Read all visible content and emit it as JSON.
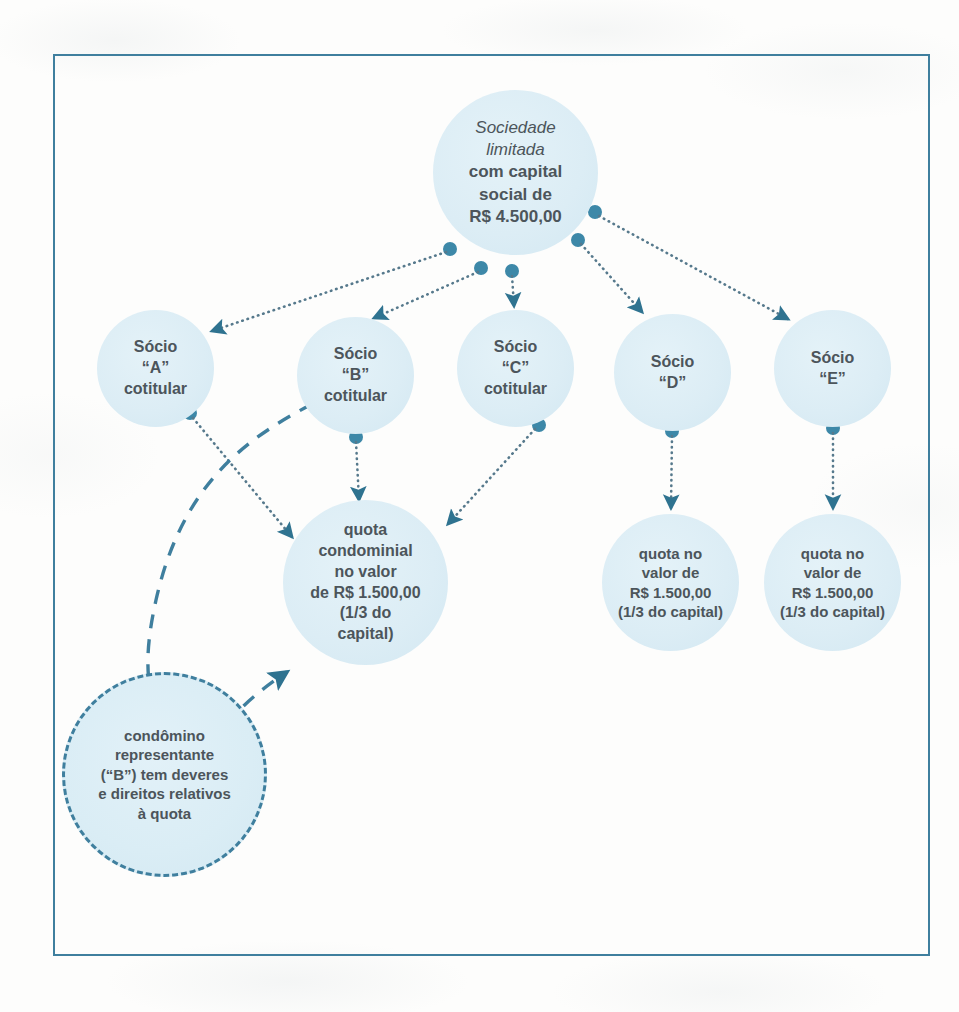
{
  "diagram": {
    "type": "organizational-flow",
    "colors": {
      "frame_border": "#3f7f9e",
      "node_fill": "#dcedf5",
      "connector": "#3f7f9e",
      "text": "#4c555b"
    },
    "nodes": [
      {
        "id": "company",
        "name": "sociedade-limitada",
        "shape": "circle",
        "style": "solid",
        "lines": [
          {
            "text": "Sociedade",
            "style": "italic"
          },
          {
            "text": "limitada",
            "style": "italic"
          },
          {
            "text": "com capital",
            "style": "bold"
          },
          {
            "text": "social de",
            "style": "bold"
          },
          {
            "text": "R$ 4.500,00",
            "style": "bold"
          }
        ]
      },
      {
        "id": "socio_a",
        "name": "socio-a",
        "shape": "circle",
        "style": "solid",
        "lines": [
          {
            "text": "Sócio",
            "style": "bold"
          },
          {
            "text": "“A”",
            "style": "bold"
          },
          {
            "text": "cotitular",
            "style": "bold"
          }
        ]
      },
      {
        "id": "socio_b",
        "name": "socio-b",
        "shape": "circle",
        "style": "solid",
        "lines": [
          {
            "text": "Sócio",
            "style": "bold"
          },
          {
            "text": "“B”",
            "style": "bold"
          },
          {
            "text": "cotitular",
            "style": "bold"
          }
        ]
      },
      {
        "id": "socio_c",
        "name": "socio-c",
        "shape": "circle",
        "style": "solid",
        "lines": [
          {
            "text": "Sócio",
            "style": "bold"
          },
          {
            "text": "“C”",
            "style": "bold"
          },
          {
            "text": "cotitular",
            "style": "bold"
          }
        ]
      },
      {
        "id": "socio_d",
        "name": "socio-d",
        "shape": "circle",
        "style": "solid",
        "lines": [
          {
            "text": "Sócio",
            "style": "bold"
          },
          {
            "text": "“D”",
            "style": "bold"
          }
        ]
      },
      {
        "id": "socio_e",
        "name": "socio-e",
        "shape": "circle",
        "style": "solid",
        "lines": [
          {
            "text": "Sócio",
            "style": "bold"
          },
          {
            "text": "“E”",
            "style": "bold"
          }
        ]
      },
      {
        "id": "quota_condominial",
        "name": "quota-condominial",
        "shape": "circle",
        "style": "solid",
        "lines": [
          {
            "text": "quota",
            "style": "bold"
          },
          {
            "text": "condominial",
            "style": "bold"
          },
          {
            "text": "no valor",
            "style": "bold"
          },
          {
            "text": "de R$ 1.500,00",
            "style": "bold"
          },
          {
            "text": "(1/3 do",
            "style": "bold"
          },
          {
            "text": "capital)",
            "style": "bold"
          }
        ]
      },
      {
        "id": "quota_d",
        "name": "quota-socio-d",
        "shape": "circle",
        "style": "solid",
        "lines": [
          {
            "text": "quota no",
            "style": "bold"
          },
          {
            "text": "valor de",
            "style": "bold"
          },
          {
            "text": "R$ 1.500,00",
            "style": "bold"
          },
          {
            "text": "(1/3 do capital)",
            "style": "bold"
          }
        ]
      },
      {
        "id": "quota_e",
        "name": "quota-socio-e",
        "shape": "circle",
        "style": "solid",
        "lines": [
          {
            "text": "quota no",
            "style": "bold"
          },
          {
            "text": "valor de",
            "style": "bold"
          },
          {
            "text": "R$ 1.500,00",
            "style": "bold"
          },
          {
            "text": "(1/3 do capital)",
            "style": "bold"
          }
        ]
      },
      {
        "id": "condomino",
        "name": "condomino-representante",
        "shape": "circle",
        "style": "dashed",
        "lines": [
          {
            "text": "condômino",
            "style": "bold"
          },
          {
            "text": "representante",
            "style": "bold"
          },
          {
            "text": "(“B”) tem deveres",
            "style": "bold"
          },
          {
            "text": "e direitos relativos",
            "style": "bold"
          },
          {
            "text": "à quota",
            "style": "bold"
          }
        ]
      }
    ],
    "edges": [
      {
        "from": "company",
        "to": "socio_a",
        "style": "dotted",
        "arrow": true
      },
      {
        "from": "company",
        "to": "socio_b",
        "style": "dotted",
        "arrow": true
      },
      {
        "from": "company",
        "to": "socio_c",
        "style": "dotted",
        "arrow": true
      },
      {
        "from": "company",
        "to": "socio_d",
        "style": "dotted",
        "arrow": true
      },
      {
        "from": "company",
        "to": "socio_e",
        "style": "dotted",
        "arrow": true
      },
      {
        "from": "socio_a",
        "to": "quota_condominial",
        "style": "dotted",
        "arrow": true
      },
      {
        "from": "socio_b",
        "to": "quota_condominial",
        "style": "dotted",
        "arrow": true
      },
      {
        "from": "socio_c",
        "to": "quota_condominial",
        "style": "dotted",
        "arrow": true
      },
      {
        "from": "socio_d",
        "to": "quota_d",
        "style": "dotted",
        "arrow": true
      },
      {
        "from": "socio_e",
        "to": "quota_e",
        "style": "dotted",
        "arrow": true
      },
      {
        "from": "socio_b",
        "to": "condomino",
        "style": "dashed",
        "arrow": true
      },
      {
        "from": "condomino",
        "to": "quota_condominial",
        "style": "dashed",
        "arrow": true
      }
    ]
  },
  "company": {
    "line1": "Sociedade",
    "line2": "limitada",
    "line3": "com capital",
    "line4": "social de",
    "line5": "R$ 4.500,00"
  },
  "socio_a": {
    "line1": "Sócio",
    "line2": "“A”",
    "line3": "cotitular"
  },
  "socio_b": {
    "line1": "Sócio",
    "line2": "“B”",
    "line3": "cotitular"
  },
  "socio_c": {
    "line1": "Sócio",
    "line2": "“C”",
    "line3": "cotitular"
  },
  "socio_d": {
    "line1": "Sócio",
    "line2": "“D”"
  },
  "socio_e": {
    "line1": "Sócio",
    "line2": "“E”"
  },
  "quota_condominial": {
    "line1": "quota",
    "line2": "condominial",
    "line3": "no valor",
    "line4": "de R$ 1.500,00",
    "line5": "(1/3 do",
    "line6": "capital)"
  },
  "quota_d": {
    "line1": "quota no",
    "line2": "valor de",
    "line3": "R$ 1.500,00",
    "line4": "(1/3 do capital)"
  },
  "quota_e": {
    "line1": "quota no",
    "line2": "valor de",
    "line3": "R$ 1.500,00",
    "line4": "(1/3 do capital)"
  },
  "condomino": {
    "line1": "condômino",
    "line2": "representante",
    "line3": "(“B”) tem deveres",
    "line4": "e direitos relativos",
    "line5": "à quota"
  }
}
